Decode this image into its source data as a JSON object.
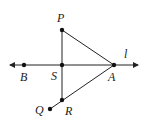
{
  "diagram": {
    "type": "geometry",
    "line_l": {
      "label": "l",
      "from": [
        9,
        65
      ],
      "to": [
        139,
        65
      ],
      "arrows": "both"
    },
    "points": {
      "P": {
        "label": "P",
        "x": 62,
        "y": 30,
        "lx": 57,
        "ly": 22
      },
      "S": {
        "label": "S",
        "x": 62,
        "y": 65,
        "lx": 51,
        "ly": 79
      },
      "A": {
        "label": "A",
        "x": 114,
        "y": 65,
        "lx": 108,
        "ly": 80
      },
      "B": {
        "label": "B",
        "x": 24,
        "y": 65,
        "lx": 20,
        "ly": 80
      },
      "R": {
        "label": "R",
        "x": 62,
        "y": 100,
        "lx": 65,
        "ly": 114
      },
      "Q": {
        "label": "Q",
        "x": 50,
        "y": 109,
        "lx": 35,
        "ly": 113
      }
    },
    "segments": [
      {
        "from": "P",
        "to": "R",
        "name": "PR"
      },
      {
        "from": "P",
        "to": "A",
        "name": "PA"
      },
      {
        "from": "A",
        "to": "Q",
        "name": "AQ"
      }
    ],
    "labels": {
      "P": "P",
      "S": "S",
      "A": "A",
      "B": "B",
      "R": "R",
      "Q": "Q",
      "l": "l"
    },
    "colors": {
      "stroke": "#222222",
      "point": "#111111"
    }
  }
}
